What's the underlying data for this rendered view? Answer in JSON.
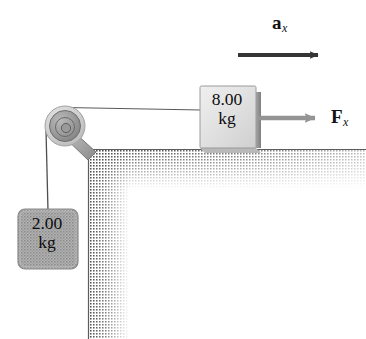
{
  "figure": {
    "type": "physics-free-body-diagram",
    "width": 366,
    "height": 339,
    "background": "#ffffff"
  },
  "labels": {
    "acceleration": {
      "symbol": "a",
      "subscript": "x"
    },
    "applied_force": {
      "symbol": "F",
      "subscript": "x"
    }
  },
  "blocks": [
    {
      "id": "block-on-table",
      "mass_value": "8.00",
      "mass_unit": "kg",
      "fill": "#dcdcdc",
      "edge": "#8d8d8d"
    },
    {
      "id": "hanging-block",
      "mass_value": "2.00",
      "mass_unit": "kg",
      "fill": "#a8a8a8",
      "edge": "#777777"
    }
  ],
  "arrows": [
    {
      "id": "acceleration-arrow",
      "color": "#353535",
      "direction": "right",
      "x1": 238,
      "y1": 55,
      "x2": 327,
      "y2": 55
    },
    {
      "id": "force-arrow",
      "color": "#949494",
      "direction": "right",
      "x1": 257,
      "y1": 118,
      "x2": 327,
      "y2": 118
    }
  ],
  "pulley": {
    "id": "pulley",
    "center_x": 65,
    "center_y": 126,
    "outer_radius": 20,
    "rim_color": "#c9c9c9",
    "hub_color": "#8f8f8f"
  },
  "strings": [
    {
      "id": "horizontal-string",
      "x1": 66,
      "y1": 107,
      "x2": 201,
      "y2": 110
    },
    {
      "id": "vertical-string",
      "x1": 46,
      "y1": 132,
      "x2": 48,
      "y2": 209
    }
  ],
  "table": {
    "id": "table-surface",
    "top_edge_y": 149,
    "corner_x": 88,
    "leg_right_x": 126,
    "shade_dark": "#6e6e6e",
    "shade_light": "#ffffff"
  }
}
